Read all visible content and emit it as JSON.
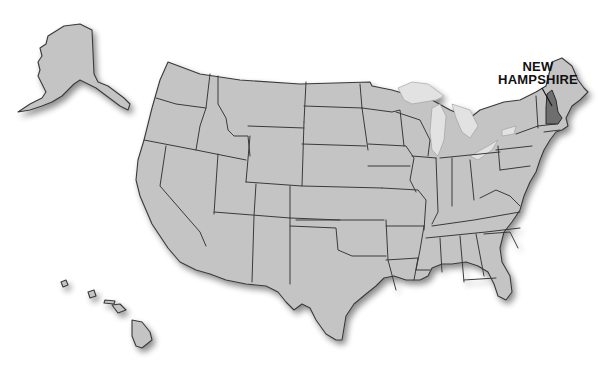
{
  "map": {
    "title": "United States",
    "highlighted_state": {
      "name": "New Hampshire",
      "label_line1": "NEW",
      "label_line2": "HAMPSHIRE",
      "fill_color": "#6e6e6e"
    },
    "base_fill_color": "#c4c4c4",
    "border_color": "#3a3a3a",
    "lake_color": "#e2e2e2",
    "background_color": "#ffffff",
    "insets": [
      "Alaska",
      "Hawaii"
    ]
  }
}
